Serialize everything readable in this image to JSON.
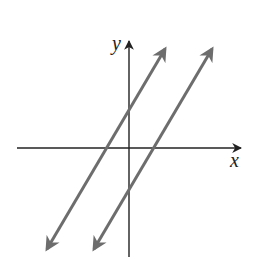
{
  "diagram": {
    "axes": {
      "x_label": "x",
      "y_label": "y"
    },
    "lines": [
      {
        "name": "line-1",
        "slope": "positive",
        "y_intercept": "positive",
        "x_intercept": "negative",
        "color": "#6d6d6d"
      },
      {
        "name": "line-2",
        "slope": "positive",
        "y_intercept": "negative",
        "x_intercept": "positive",
        "color": "#6d6d6d"
      }
    ],
    "axis_color": "#222222",
    "relationship": "parallel"
  }
}
